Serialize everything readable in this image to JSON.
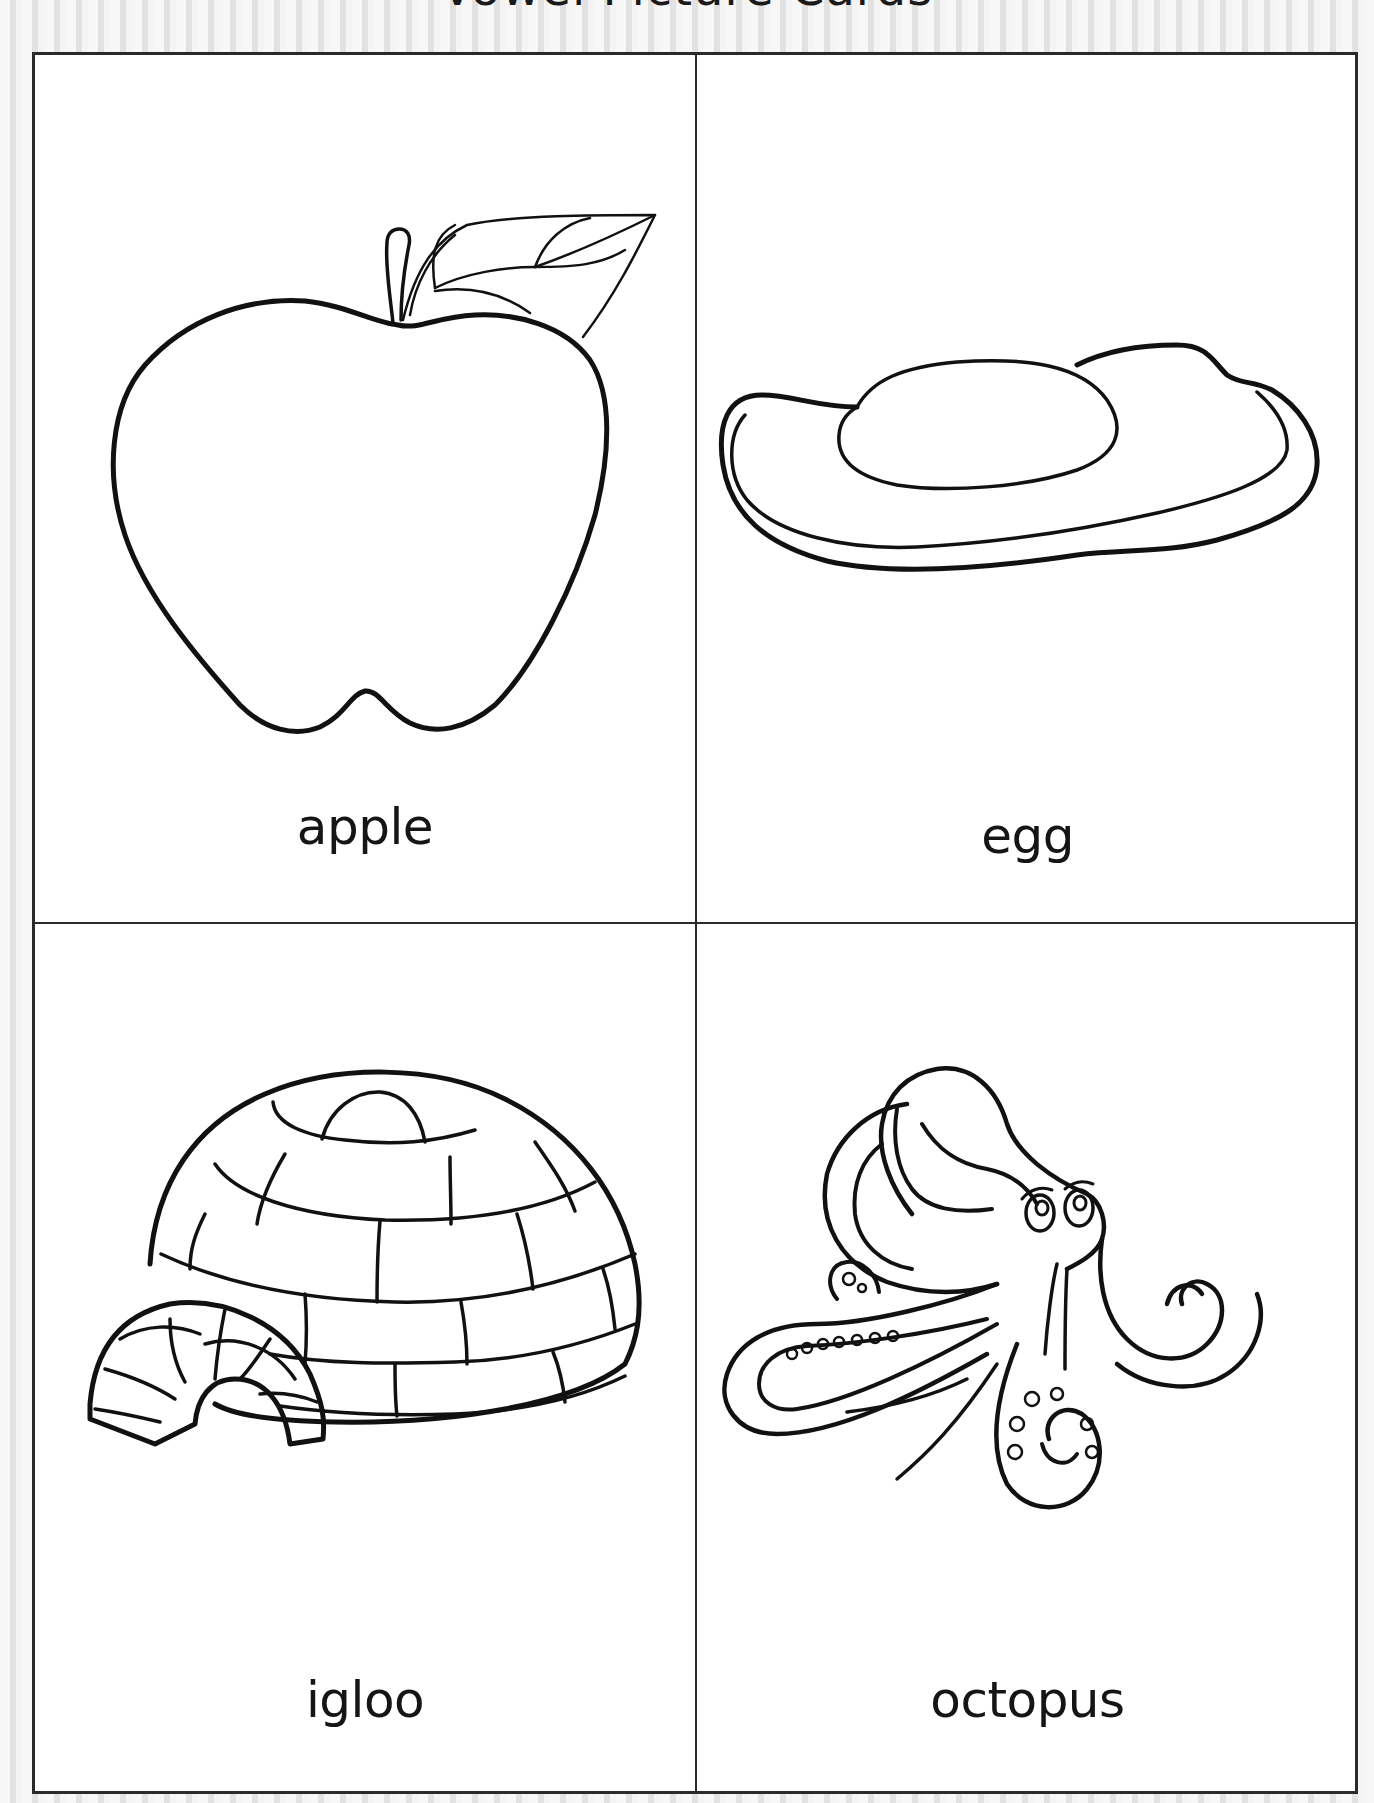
{
  "page": {
    "title": "Vowel Picture Cards"
  },
  "cards": [
    {
      "word": "apple",
      "icon": "apple-icon",
      "position": "top-left"
    },
    {
      "word": "egg",
      "icon": "egg-icon",
      "position": "top-right"
    },
    {
      "word": "igloo",
      "icon": "igloo-icon",
      "position": "bottom-left"
    },
    {
      "word": "octopus",
      "icon": "octopus-icon",
      "position": "bottom-right"
    }
  ],
  "colors": {
    "line": "#111111",
    "card_background": "#ffffff",
    "page_background": "#ececec"
  }
}
